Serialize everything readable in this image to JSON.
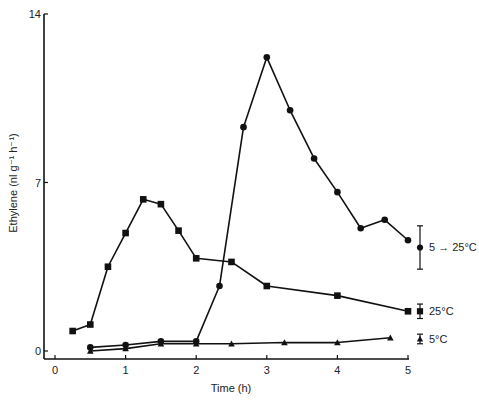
{
  "chart_data": {
    "type": "line",
    "title": "",
    "xlabel": "Time (h)",
    "ylabel": "Ethylene (nl g⁻¹ h⁻¹)",
    "xlim": [
      0,
      5
    ],
    "ylim": [
      0,
      14
    ],
    "x_ticks": [
      "0",
      "1",
      "2",
      "3",
      "4",
      "5"
    ],
    "y_ticks": [
      "0",
      "7",
      "14"
    ],
    "grid": false,
    "legend_position": "right, inline at series ends",
    "series": [
      {
        "name": "5 → 25°C",
        "marker": "circle",
        "x": [
          0.5,
          1.0,
          1.5,
          2.0,
          2.33,
          2.67,
          3.0,
          3.33,
          3.67,
          4.0,
          4.33,
          4.67,
          5.0
        ],
        "y": [
          0.15,
          0.25,
          0.4,
          0.4,
          2.7,
          9.3,
          12.2,
          10.0,
          8.0,
          6.6,
          5.1,
          5.45,
          4.6
        ],
        "error_bar": {
          "center": 4.3,
          "low": 3.4,
          "high": 5.2
        }
      },
      {
        "name": "25°C",
        "marker": "square",
        "x": [
          0.25,
          0.5,
          0.75,
          1.0,
          1.25,
          1.5,
          1.75,
          2.0,
          2.5,
          3.0,
          4.0,
          5.0
        ],
        "y": [
          0.83,
          1.1,
          3.5,
          4.9,
          6.3,
          6.1,
          5.0,
          3.85,
          3.7,
          2.7,
          2.3,
          1.65
        ],
        "error_bar": {
          "center": 1.65,
          "low": 1.35,
          "high": 1.95
        }
      },
      {
        "name": "5°C",
        "marker": "triangle",
        "x": [
          0.5,
          1.0,
          1.5,
          2.0,
          2.5,
          3.25,
          4.0,
          4.75
        ],
        "y": [
          0.0,
          0.1,
          0.3,
          0.3,
          0.3,
          0.35,
          0.35,
          0.55
        ],
        "error_bar": {
          "center": 0.5,
          "low": 0.3,
          "high": 0.7
        }
      }
    ]
  }
}
